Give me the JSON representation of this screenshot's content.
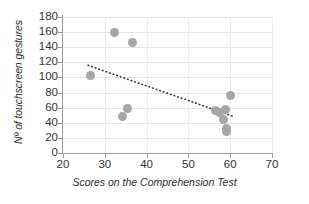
{
  "chart_data": {
    "type": "scatter",
    "title": "",
    "xlabel": "Scores on the Comprehension Test",
    "ylabel": "Nº of touchscreen gestures",
    "xlim": [
      20,
      70
    ],
    "ylim": [
      0,
      180
    ],
    "xticks": [
      20,
      30,
      40,
      50,
      60,
      70
    ],
    "yticks": [
      0,
      20,
      40,
      60,
      80,
      100,
      120,
      140,
      160,
      180
    ],
    "xtick_labels": [
      "20",
      "30",
      "40",
      "50",
      "60",
      "70"
    ],
    "ytick_labels": [
      "0",
      "20",
      "40",
      "60",
      "80",
      "100",
      "120",
      "140",
      "160",
      "180"
    ],
    "grid": true,
    "legend": false,
    "marker_color": "#a6a6a6",
    "marker_size": 9,
    "points": [
      {
        "x": 26.5,
        "y": 102
      },
      {
        "x": 32.4,
        "y": 160
      },
      {
        "x": 36.6,
        "y": 146
      },
      {
        "x": 35.4,
        "y": 59
      },
      {
        "x": 34.3,
        "y": 48
      },
      {
        "x": 56.6,
        "y": 56
      },
      {
        "x": 57.4,
        "y": 54
      },
      {
        "x": 58.9,
        "y": 57
      },
      {
        "x": 58.4,
        "y": 45
      },
      {
        "x": 59.0,
        "y": 33
      },
      {
        "x": 59.1,
        "y": 29
      },
      {
        "x": 60.0,
        "y": 76
      }
    ],
    "trendline": {
      "style": "dotted",
      "color": "#333333",
      "x_start": 26.0,
      "y_start": 116,
      "x_end": 61.0,
      "y_end": 48
    }
  },
  "axis": {
    "line_color": "#9a9a9a",
    "grid_color": "#e4e4e4"
  }
}
